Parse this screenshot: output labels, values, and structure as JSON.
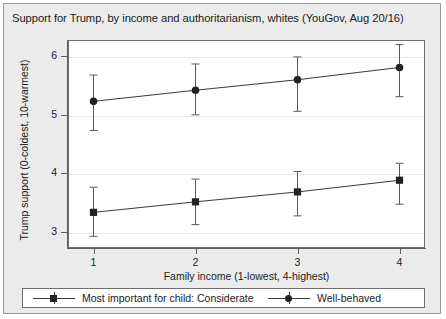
{
  "chart_data": {
    "type": "line",
    "title": "Support for Trump, by income and authoritarianism, whites (YouGov, Aug 20/16)",
    "xlabel": "Family income (1-lowest, 4-highest)",
    "ylabel": "Trump support (0-coldest, 10-warmest)",
    "x": [
      1,
      2,
      3,
      4
    ],
    "xtick_labels": [
      "1",
      "2",
      "3",
      "4"
    ],
    "xlim": [
      0.75,
      4.25
    ],
    "ytick_labels": [
      "3",
      "4",
      "5",
      "6"
    ],
    "yticks": [
      3,
      4,
      5,
      6
    ],
    "ylim": [
      2.72,
      6.28
    ],
    "grid": true,
    "legend_position": "bottom",
    "series": [
      {
        "name": "Most important for child: Considerate",
        "marker": "square",
        "color": "#222222",
        "values": [
          3.33,
          3.51,
          3.68,
          3.88
        ],
        "ci_low": [
          2.92,
          3.12,
          3.27,
          3.47
        ],
        "ci_high": [
          3.76,
          3.9,
          4.03,
          4.17
        ]
      },
      {
        "name": "Well-behaved",
        "marker": "circle",
        "color": "#222222",
        "values": [
          5.23,
          5.42,
          5.6,
          5.81
        ],
        "ci_low": [
          4.73,
          5.0,
          5.06,
          5.31
        ],
        "ci_high": [
          5.68,
          5.87,
          5.99,
          6.2
        ]
      }
    ]
  }
}
